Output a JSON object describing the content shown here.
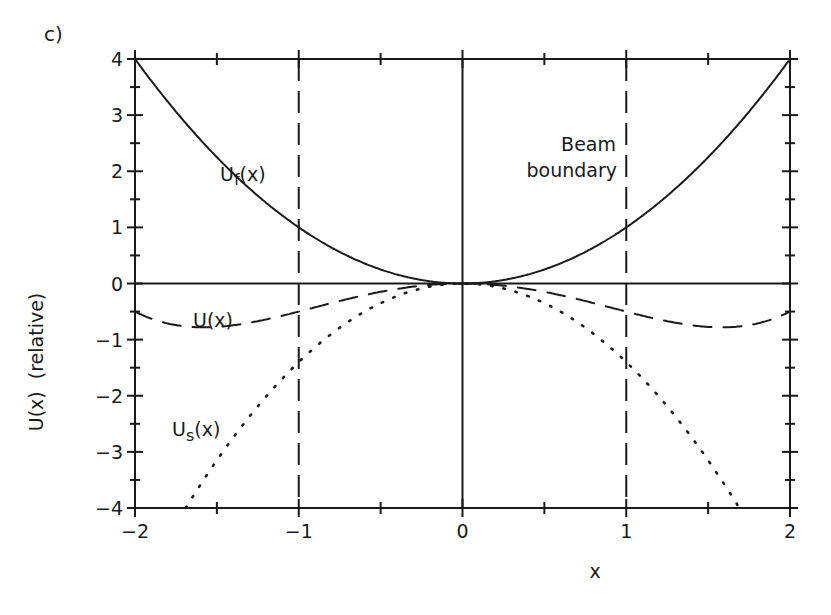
{
  "panel_label": "c)",
  "chart_data": {
    "type": "line",
    "title": "",
    "panel": "c)",
    "xlabel": "x",
    "ylabel": "U(x)  (relative)",
    "xlim": [
      -2,
      2
    ],
    "ylim": [
      -4,
      4
    ],
    "x_ticks": [
      -2,
      -1,
      0,
      1,
      2
    ],
    "x_tick_labels": [
      "−2",
      "−1",
      "0",
      "1",
      "2"
    ],
    "y_ticks": [
      -4,
      -3,
      -2,
      -1,
      0,
      1,
      2,
      3,
      4
    ],
    "y_tick_labels": [
      "−4",
      "−3",
      "−2",
      "−1",
      "0",
      "1",
      "2",
      "3",
      "4"
    ],
    "grid": false,
    "legend": "none (inline curve labels)",
    "series": [
      {
        "name": "Uf(x)",
        "label_main": "U",
        "label_sub": "f",
        "label_tail": "(x)",
        "style": "solid",
        "x": [
          -2,
          -1.5,
          -1,
          -0.5,
          0,
          0.5,
          1,
          1.5,
          2
        ],
        "values": [
          4,
          2.25,
          1,
          0.25,
          0,
          0.25,
          1,
          2.25,
          4
        ]
      },
      {
        "name": "U(x)",
        "label_main": "U(x)",
        "style": "dashed",
        "x": [
          -2,
          -1.5,
          -1,
          -0.5,
          0,
          0.5,
          1,
          1.5,
          2
        ],
        "values": [
          -0.5,
          -0.77,
          -0.5,
          -0.15,
          0,
          -0.15,
          -0.5,
          -0.77,
          -0.5
        ]
      },
      {
        "name": "Us(x)",
        "label_main": "U",
        "label_sub": "s",
        "label_tail": "(x)",
        "style": "dotted",
        "x": [
          -1.7,
          -1.5,
          -1,
          -0.5,
          0,
          0.5,
          1,
          1.5,
          1.7
        ],
        "values": [
          -4.0,
          -3.15,
          -1.4,
          -0.35,
          0,
          -0.35,
          -1.4,
          -3.15,
          -4.0
        ]
      }
    ],
    "vertical_lines": [
      {
        "x": -1,
        "style": "dashed",
        "meaning": "beam boundary"
      },
      {
        "x": 0,
        "style": "solid"
      },
      {
        "x": 1,
        "style": "dashed",
        "meaning": "beam boundary"
      }
    ],
    "horizontal_lines": [
      {
        "y": 0,
        "style": "solid"
      }
    ],
    "annotations": [
      {
        "text_line1": "Beam",
        "text_line2": "boundary",
        "x": 1,
        "y": 3.3
      }
    ]
  }
}
